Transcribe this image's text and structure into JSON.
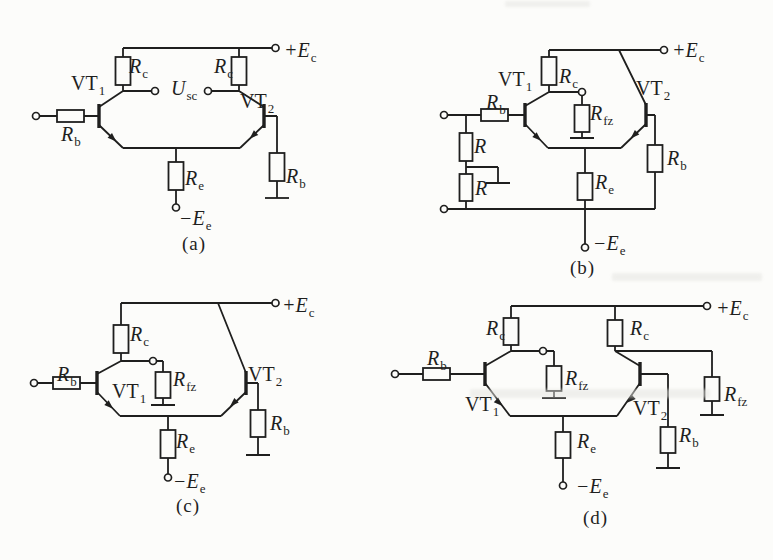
{
  "colors": {
    "ink": "#1f1f1e",
    "paper": "#fcfcfa"
  },
  "circuits": {
    "a": {
      "caption": "(a)",
      "labels": {
        "vt1": {
          "main": "VT",
          "sub": "1"
        },
        "vt2": {
          "main": "VT",
          "sub": "2"
        },
        "rb_in": {
          "main": "R",
          "sub": "b"
        },
        "rc_left": {
          "main": "R",
          "sub": "c"
        },
        "rc_right": {
          "main": "R",
          "sub": "c"
        },
        "usc": {
          "main": "U",
          "sub": "sc"
        },
        "re": {
          "main": "R",
          "sub": "e"
        },
        "rb_right": {
          "main": "R",
          "sub": "b"
        },
        "ec": {
          "main": "+E",
          "sub": "c"
        },
        "ee": {
          "main": "−E",
          "sub": "e"
        }
      }
    },
    "b": {
      "caption": "(b)",
      "labels": {
        "vt1": {
          "main": "VT",
          "sub": "1"
        },
        "vt2": {
          "main": "VT",
          "sub": "2"
        },
        "rb_in": {
          "main": "R",
          "sub": "b"
        },
        "r_upper": {
          "main": "R",
          "sub": ""
        },
        "r_lower": {
          "main": "R",
          "sub": ""
        },
        "rc": {
          "main": "R",
          "sub": "c"
        },
        "rfz": {
          "main": "R",
          "sub": "fz"
        },
        "re": {
          "main": "R",
          "sub": "e"
        },
        "rb_right": {
          "main": "R",
          "sub": "b"
        },
        "ec": {
          "main": "+E",
          "sub": "c"
        },
        "ee": {
          "main": "−E",
          "sub": "e"
        }
      }
    },
    "c": {
      "caption": "(c)",
      "labels": {
        "vt1": {
          "main": "VT",
          "sub": "1"
        },
        "vt2": {
          "main": "VT",
          "sub": "2"
        },
        "rb_in": {
          "main": "R",
          "sub": "b"
        },
        "rc": {
          "main": "R",
          "sub": "c"
        },
        "rfz": {
          "main": "R",
          "sub": "fz"
        },
        "re": {
          "main": "R",
          "sub": "e"
        },
        "rb_right": {
          "main": "R",
          "sub": "b"
        },
        "ec": {
          "main": "+E",
          "sub": "c"
        },
        "ee": {
          "main": "−E",
          "sub": "e"
        }
      }
    },
    "d": {
      "caption": "(d)",
      "labels": {
        "vt1": {
          "main": "VT",
          "sub": "1"
        },
        "vt2": {
          "main": "VT",
          "sub": "2"
        },
        "rb_in": {
          "main": "R",
          "sub": "b"
        },
        "rc_left": {
          "main": "R",
          "sub": "c"
        },
        "rc_right": {
          "main": "R",
          "sub": "c"
        },
        "rfz_mid": {
          "main": "R",
          "sub": "fz"
        },
        "rfz_right": {
          "main": "R",
          "sub": "fz"
        },
        "re": {
          "main": "R",
          "sub": "e"
        },
        "rb_right": {
          "main": "R",
          "sub": "b"
        },
        "ec": {
          "main": "+E",
          "sub": "c"
        },
        "ee": {
          "main": "−E",
          "sub": "e"
        }
      }
    }
  }
}
